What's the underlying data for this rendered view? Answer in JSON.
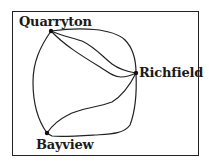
{
  "diagram": {
    "type": "graph",
    "nodes": [
      {
        "id": "quarryton",
        "label": "Quarryton",
        "x": 51,
        "y": 31
      },
      {
        "id": "richfield",
        "label": "Richfield",
        "x": 136,
        "y": 73
      },
      {
        "id": "bayview",
        "label": "Bayview",
        "x": 47,
        "y": 133
      }
    ],
    "edges": [
      {
        "from": "quarryton",
        "to": "richfield",
        "style": "outer-arc"
      },
      {
        "from": "quarryton",
        "to": "richfield",
        "style": "middle-curve"
      },
      {
        "from": "quarryton",
        "to": "richfield",
        "style": "lower-curve"
      },
      {
        "from": "quarryton",
        "to": "bayview",
        "style": "left-arc"
      },
      {
        "from": "richfield",
        "to": "bayview",
        "style": "upper-curve"
      },
      {
        "from": "richfield",
        "to": "bayview",
        "style": "bottom-arc"
      }
    ],
    "colors": {
      "line": "#222222",
      "node": "#111111",
      "background": "#ffffff"
    }
  }
}
